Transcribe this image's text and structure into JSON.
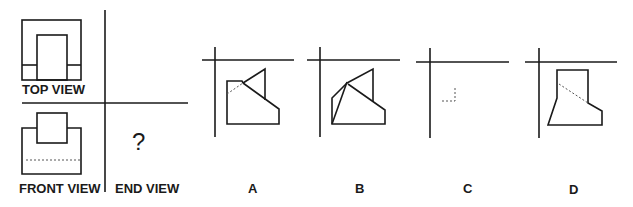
{
  "puzzle": {
    "views": {
      "top_label": "TOP VIEW",
      "front_label": "FRONT VIEW",
      "end_label": "END VIEW",
      "unknown_mark": "?"
    },
    "options": [
      {
        "label": "A"
      },
      {
        "label": "B"
      },
      {
        "label": "C"
      },
      {
        "label": "D"
      }
    ]
  },
  "colors": {
    "stroke": "#1a1a1a",
    "dashed": "#555555",
    "background": "#ffffff"
  }
}
